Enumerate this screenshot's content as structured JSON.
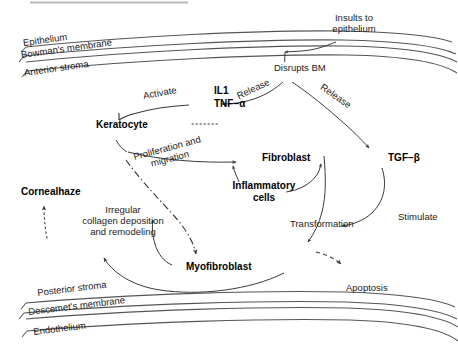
{
  "anatomy": {
    "top_layers": [
      {
        "label": "Epithelium"
      },
      {
        "label": "Bowman's membrane"
      },
      {
        "label": "Anterior stroma"
      }
    ],
    "bottom_layers": [
      {
        "label": "Posterior stroma"
      },
      {
        "label": "Descemet's membrane"
      },
      {
        "label": "Endothelium"
      }
    ]
  },
  "nodes": {
    "insults": "Insults to\nepithelium",
    "insults_line1": "Insults to",
    "insults_line2": "epithelium",
    "disrupts_bm": "Disrupts BM",
    "il1": "IL1",
    "tnf_alpha": "TNF−α",
    "tgf_beta": "TGF−β",
    "keratocyte": "Keratocyte",
    "fibroblast": "Fibroblast",
    "inflammatory_line1": "Inflammatory",
    "inflammatory_line2": "cells",
    "myofibroblast": "Myofibroblast",
    "corneal_haze": "Cornealhaze",
    "apoptosis": "Apoptosis",
    "transformation": "Transformation"
  },
  "edges": {
    "release_left": "Release",
    "release_right": "Release",
    "activate": "Activate",
    "proliferation_line1": "Proliferation and",
    "proliferation_line2": "migration",
    "stimulate": "Stimulate",
    "collagen_line1": "Irregular",
    "collagen_line2": "collagen deposition",
    "collagen_line3": "and remodeling"
  },
  "colors": {
    "stroke": "#3a3a3a",
    "layer_line": "#555555",
    "text": "#000000",
    "background": "#ffffff"
  }
}
